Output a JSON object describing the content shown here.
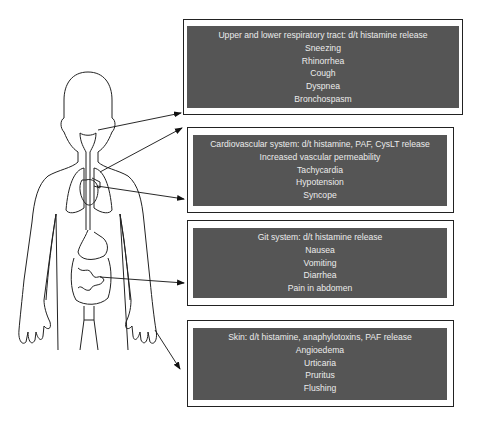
{
  "figure": {
    "boxes": [
      {
        "id": "respiratory",
        "title": "Upper and lower respiratory tract: d/t histamine release",
        "items": [
          "Sneezing",
          "Rhinorrhea",
          "Cough",
          "Dyspnea",
          "Bronchospasm"
        ]
      },
      {
        "id": "cardiovascular",
        "title": "Cardiovascular system: d/t histamine, PAF, CysLT release",
        "items": [
          "Increased vascular permeability",
          "Tachycardia",
          "Hypotension",
          "Syncope"
        ]
      },
      {
        "id": "git",
        "title": "Git system: d/t histamine release",
        "items": [
          "Nausea",
          "Vomiting",
          "Diarrhea",
          "Pain in abdomen"
        ]
      },
      {
        "id": "skin",
        "title": "Skin: d/t histamine, anaphylotoxins, PAF release",
        "items": [
          "Angioedema",
          "Urticaria",
          "Pruritus",
          "Flushing"
        ]
      }
    ],
    "colors": {
      "box_fill": "#555555",
      "box_text": "#ececec",
      "outline": "#222222"
    }
  }
}
